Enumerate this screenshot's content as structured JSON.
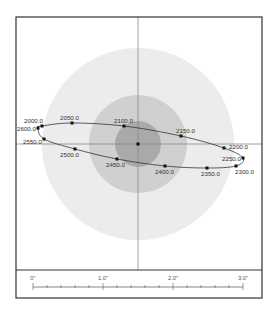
{
  "chart_data": {
    "type": "scatter",
    "title": "",
    "center": {
      "x": 138,
      "y": 144
    },
    "rings": [
      {
        "name": "outer",
        "radius": 96,
        "color": "#ececec"
      },
      {
        "name": "middle",
        "radius": 49,
        "color": "#d0d0d0"
      },
      {
        "name": "inner",
        "radius": 23,
        "color": "#a9a9a9"
      }
    ],
    "points": [
      {
        "label": "2000.0",
        "x": 42,
        "y": 126,
        "lx": 24,
        "ly": 123,
        "anchor": "start"
      },
      {
        "label": "2050.0",
        "x": 72,
        "y": 123,
        "lx": 60,
        "ly": 120,
        "anchor": "start"
      },
      {
        "label": "2100.0",
        "x": 124,
        "y": 126,
        "lx": 114,
        "ly": 123,
        "anchor": "start"
      },
      {
        "label": "2150.0",
        "x": 181,
        "y": 136,
        "lx": 176,
        "ly": 133,
        "anchor": "start"
      },
      {
        "label": "2200.0",
        "x": 224,
        "y": 148,
        "lx": 229,
        "ly": 149,
        "anchor": "start"
      },
      {
        "label": "2250.0",
        "x": 243,
        "y": 158,
        "lx": 222,
        "ly": 161,
        "anchor": "start"
      },
      {
        "label": "2300.0",
        "x": 236,
        "y": 166,
        "lx": 235,
        "ly": 174,
        "anchor": "start"
      },
      {
        "label": "2350.0",
        "x": 207,
        "y": 168,
        "lx": 201,
        "ly": 176,
        "anchor": "start"
      },
      {
        "label": "2400.0",
        "x": 165,
        "y": 166,
        "lx": 155,
        "ly": 174,
        "anchor": "start"
      },
      {
        "label": "2450.0",
        "x": 117,
        "y": 159,
        "lx": 106,
        "ly": 167,
        "anchor": "start"
      },
      {
        "label": "2500.0",
        "x": 75,
        "y": 149,
        "lx": 60,
        "ly": 157,
        "anchor": "start"
      },
      {
        "label": "2550.0",
        "x": 44,
        "y": 139,
        "lx": 23,
        "ly": 144,
        "anchor": "start"
      },
      {
        "label": "2600.0",
        "x": 38,
        "y": 128,
        "lx": 17,
        "ly": 131,
        "anchor": "start"
      }
    ],
    "center_point": {
      "x": 138,
      "y": 144
    },
    "grid": false,
    "legend": null
  },
  "scale_bar": {
    "labels": [
      "0\"",
      "1.0\"",
      "2.0\"",
      "3.0\""
    ],
    "major_values": [
      0,
      1.0,
      2.0,
      3.0
    ],
    "minor_step": 0.2,
    "unit": "arcsec"
  },
  "colors": {
    "frame": "#333333",
    "axis": "#888888",
    "path": "#333333",
    "point": "#111111",
    "label": "#333333"
  }
}
